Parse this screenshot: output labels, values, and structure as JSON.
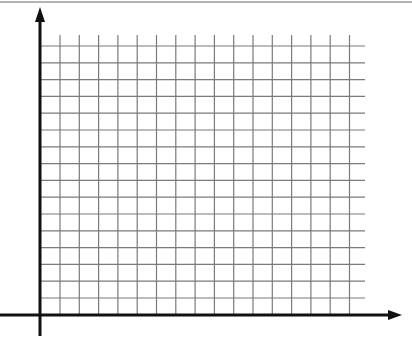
{
  "figure": {
    "kind": "blank coordinate grid",
    "caption_cropped": true,
    "colors": {
      "background": "#ffffff",
      "axis": "#111111",
      "grid": "#7a7a7a",
      "top_rule": "#9a9a9a"
    }
  },
  "axes": {
    "origin": [
      40,
      315
    ],
    "x_axis": {
      "from": [
        0,
        315
      ],
      "to": [
        402,
        315
      ],
      "arrow": "right"
    },
    "y_axis": {
      "from": [
        40,
        336
      ],
      "to": [
        40,
        7
      ],
      "arrow": "up"
    }
  },
  "grid": {
    "vertical_lines_x": [
      60,
      79.3,
      98.6,
      117.9,
      137.2,
      156.5,
      175.8,
      195.1,
      214.4,
      233.7,
      253,
      272.3,
      291.6,
      310.9,
      330.2,
      349.5
    ],
    "vertical_top": 35,
    "vertical_bottom": 315,
    "horizontal_lines_y": [
      46,
      62.8,
      79.6,
      96.4,
      113.2,
      130,
      146.8,
      163.6,
      180.4,
      197.2,
      214,
      230.8,
      247.6,
      264.4,
      281.2,
      298
    ],
    "horizontal_left": 40,
    "horizontal_right": 365,
    "columns": 16,
    "rows": 16
  }
}
